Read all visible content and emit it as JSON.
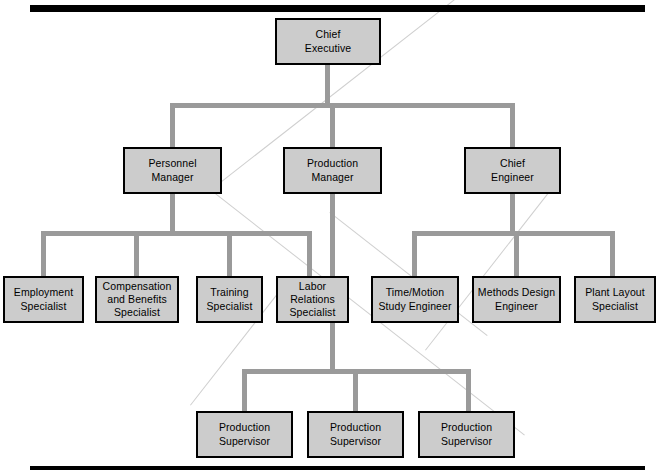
{
  "diagram": {
    "type": "organizational-chart",
    "box_fill": "#cccccc",
    "box_border": "#000000",
    "connector_color": "#9a9a9a",
    "rule_color": "#000000",
    "nodes": [
      {
        "id": "chief-executive",
        "label": "Chief\nExecutive",
        "level": 0,
        "x": 275,
        "y": 18,
        "w": 106,
        "h": 47
      },
      {
        "id": "personnel-manager",
        "label": "Personnel\nManager",
        "level": 1,
        "x": 123,
        "y": 147,
        "w": 99,
        "h": 47
      },
      {
        "id": "production-manager",
        "label": "Production\nManager",
        "level": 1,
        "x": 283,
        "y": 147,
        "w": 99,
        "h": 47
      },
      {
        "id": "chief-engineer",
        "label": "Chief\nEngineer",
        "level": 1,
        "x": 464,
        "y": 147,
        "w": 97,
        "h": 47
      },
      {
        "id": "employment-specialist",
        "label": "Employment\nSpecialist",
        "level": 2,
        "x": 3,
        "y": 276,
        "w": 81,
        "h": 47
      },
      {
        "id": "compensation-and-benefits-specialist",
        "label": "Compensation\nand Benefits\nSpecialist",
        "level": 2,
        "x": 95,
        "y": 276,
        "w": 84,
        "h": 47
      },
      {
        "id": "training-specialist",
        "label": "Training\nSpecialist",
        "level": 2,
        "x": 196,
        "y": 276,
        "w": 67,
        "h": 47
      },
      {
        "id": "labor-relations-specialist",
        "label": "Labor\nRelations\nSpecialist",
        "level": 2,
        "x": 276,
        "y": 276,
        "w": 73,
        "h": 47
      },
      {
        "id": "time-motion-study-engineer",
        "label": "Time/Motion\nStudy Engineer",
        "level": 2,
        "x": 371,
        "y": 276,
        "w": 88,
        "h": 47
      },
      {
        "id": "methods-design-engineer",
        "label": "Methods Design\nEngineer",
        "level": 2,
        "x": 472,
        "y": 276,
        "w": 89,
        "h": 47
      },
      {
        "id": "plant-layout-specialist",
        "label": "Plant Layout\nSpecialist",
        "level": 2,
        "x": 574,
        "y": 276,
        "w": 82,
        "h": 47
      },
      {
        "id": "production-supervisor-1",
        "label": "Production\nSupervisor",
        "level": 3,
        "x": 196,
        "y": 411,
        "w": 97,
        "h": 47
      },
      {
        "id": "production-supervisor-2",
        "label": "Production\nSupervisor",
        "level": 3,
        "x": 307,
        "y": 411,
        "w": 97,
        "h": 47
      },
      {
        "id": "production-supervisor-3",
        "label": "Production\nSupervisor",
        "level": 3,
        "x": 418,
        "y": 411,
        "w": 97,
        "h": 47
      }
    ],
    "relationships": [
      {
        "parent": "chief-executive",
        "children": [
          "personnel-manager",
          "production-manager",
          "chief-engineer"
        ]
      },
      {
        "parent": "personnel-manager",
        "children": [
          "employment-specialist",
          "compensation-and-benefits-specialist",
          "training-specialist",
          "labor-relations-specialist"
        ]
      },
      {
        "parent": "chief-engineer",
        "children": [
          "time-motion-study-engineer",
          "methods-design-engineer",
          "plant-layout-specialist"
        ]
      },
      {
        "parent": "production-manager",
        "children": [
          "production-supervisor-1",
          "production-supervisor-2",
          "production-supervisor-3"
        ]
      }
    ]
  }
}
